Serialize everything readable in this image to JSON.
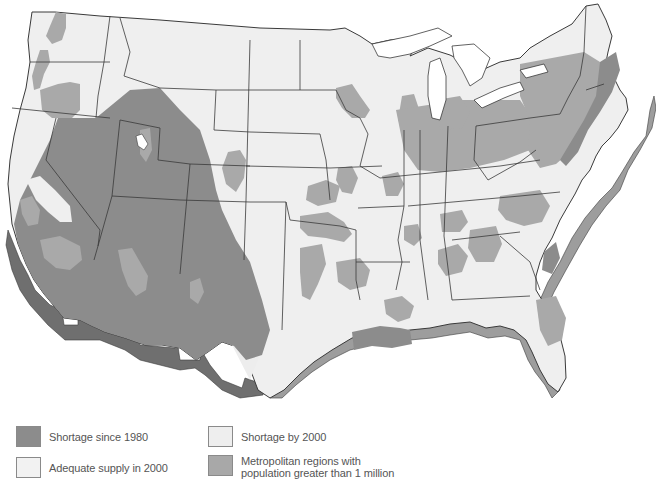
{
  "map": {
    "title": "",
    "region": "Contiguous United States",
    "colors": {
      "background": "#ffffff",
      "adequate_supply": "#efefef",
      "shortage_by_2000": "#ededed",
      "metro": "#a9a9a9",
      "shortage_since_1980": "#8c8c8c",
      "extrusion_dark": "#6f6f6f",
      "extrusion_light": "#9d9d9d",
      "state_border": "#3a3a3a",
      "water": "#ffffff"
    }
  },
  "legend": {
    "items": [
      {
        "key": "shortage_since_1980",
        "label": "Shortage since 1980",
        "color": "#8c8c8c"
      },
      {
        "key": "adequate_supply",
        "label": "Adequate supply in 2000",
        "color": "#f2f2f2"
      },
      {
        "key": "shortage_by_2000",
        "label": "Shortage by 2000",
        "color": "#eeeeee"
      },
      {
        "key": "metro",
        "label_line1": "Metropolitan regions with",
        "label_line2": "population greater than 1 million",
        "color": "#a8a8a8"
      }
    ]
  }
}
